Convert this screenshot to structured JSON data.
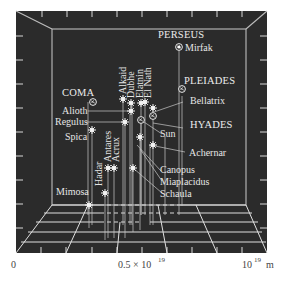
{
  "figure": {
    "background_color": "#2b2b2b",
    "line_color": "#e0e0e0"
  },
  "axis": {
    "labels": [
      {
        "text": "0",
        "x": 14
      },
      {
        "text": "0.5 × 10",
        "sup": "19",
        "x": 118
      },
      {
        "text": "10",
        "sup": "19",
        "unit": "m",
        "x": 243
      }
    ]
  },
  "clusters": [
    {
      "name": "PERSEUS",
      "star": "Mirfak"
    },
    {
      "name": "COMA"
    },
    {
      "name": "PLEIADES"
    },
    {
      "name": "HYADES"
    }
  ],
  "stars": {
    "horizontal_labels": [
      "Mirfak",
      "Alioth",
      "Regulus",
      "Spica",
      "Bellatrix",
      "Sun",
      "Achernar",
      "Canopus",
      "Miaplacidus",
      "Schaula",
      "Mimosa"
    ],
    "vertical_labels": [
      "Alkaid",
      "Dubhe",
      "Elatnin",
      "El Nath",
      "Hadar",
      "Antares",
      "Acrux"
    ]
  },
  "labels": {
    "perseus": "PERSEUS",
    "mirfak": "Mirfak",
    "coma": "COMA",
    "pleiades": "PLEIADES",
    "hyades": "HYADES",
    "alioth": "Alioth",
    "regulus": "Regulus",
    "spica": "Spica",
    "bellatrix": "Bellatrix",
    "sun": "Sun",
    "achernar": "Achernar",
    "canopus": "Canopus",
    "miaplacidus": "Miaplacidus",
    "schaula": "Schaula",
    "mimosa": "Mimosa",
    "alkaid": "Alkaid",
    "dubhe": "Dubhe",
    "elatnin": "Elatnin",
    "elnath": "El Nath",
    "hadar": "Hadar",
    "antares": "Antares",
    "acrux": "Acrux",
    "axis_zero": "0",
    "axis_half": "0.5 × 10",
    "axis_half_exp": "19",
    "axis_full": "10",
    "axis_full_exp": "19",
    "axis_unit": "m"
  }
}
